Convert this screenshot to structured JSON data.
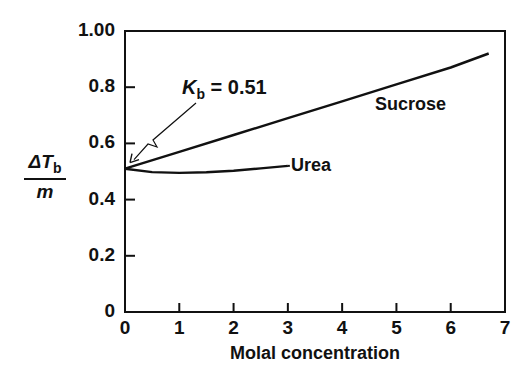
{
  "chart_data": {
    "type": "line",
    "title": "",
    "xlabel": "Molal concentration",
    "ylabel": "ΔTb / m",
    "ylabel_parts": {
      "numerator_symbol": "ΔT",
      "numerator_sub": "b",
      "denominator": "m"
    },
    "xlim": [
      0,
      7
    ],
    "ylim": [
      0,
      1.0
    ],
    "grid": false,
    "legend": "inline labels",
    "x_ticks": [
      "0",
      "1",
      "2",
      "3",
      "4",
      "5",
      "6",
      "7"
    ],
    "y_ticks": [
      "0",
      "0.2",
      "0.4",
      "0.6",
      "0.8",
      "1.00"
    ],
    "series": [
      {
        "name": "Sucrose",
        "x": [
          0,
          1,
          2,
          3,
          4,
          5,
          6,
          6.7
        ],
        "values": [
          0.51,
          0.57,
          0.63,
          0.69,
          0.75,
          0.81,
          0.87,
          0.92
        ]
      },
      {
        "name": "Urea",
        "x": [
          0,
          0.5,
          1,
          1.5,
          2,
          2.5,
          3
        ],
        "values": [
          0.51,
          0.498,
          0.495,
          0.497,
          0.503,
          0.511,
          0.52
        ]
      }
    ],
    "annotations": [
      {
        "text_symbol": "K",
        "text_sub": "b",
        "text_value": "= 0.51",
        "points_to": {
          "x": 0,
          "y": 0.51
        }
      }
    ]
  },
  "labels": {
    "sucrose": "Sucrose",
    "urea": "Urea",
    "kb_symbol": "K",
    "kb_sub": "b",
    "kb_value": " = 0.51",
    "ylabel_symbol": "ΔT",
    "ylabel_sub": "b",
    "ylabel_den": "m",
    "xlabel": "Molal concentration"
  }
}
